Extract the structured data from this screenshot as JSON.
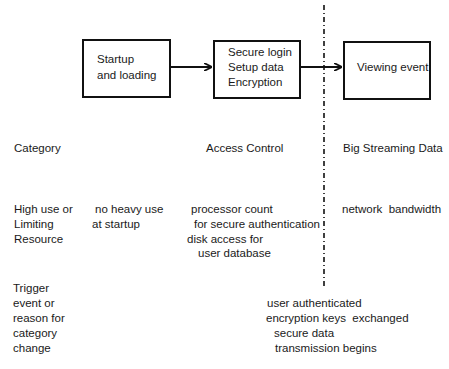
{
  "flow": {
    "boxes": [
      {
        "id": "startup",
        "lines": [
          "Startup",
          "and loading"
        ]
      },
      {
        "id": "secure-login",
        "lines": [
          "Secure login",
          "Setup data",
          "Encryption"
        ]
      },
      {
        "id": "viewing",
        "lines": [
          "Viewing event"
        ]
      }
    ],
    "arrows": [
      {
        "from": "startup",
        "to": "secure-login"
      },
      {
        "from": "secure-login",
        "to": "viewing"
      }
    ],
    "divider": {
      "style": "dash-dot",
      "between": [
        "secure-login",
        "viewing"
      ]
    }
  },
  "rows": {
    "category": {
      "label": "Category",
      "access_control": "Access Control",
      "big_streaming": "Big Streaming Data"
    },
    "resource": {
      "label_lines": [
        "High use or",
        "Limiting",
        "Resource"
      ],
      "startup_lines": [
        "no heavy use",
        "at startup"
      ],
      "access_lines": [
        "processor count",
        "for secure authentication",
        "disk access for",
        "user database"
      ],
      "streaming_lines": [
        "network  bandwidth"
      ]
    },
    "trigger": {
      "label_lines": [
        "Trigger",
        "event or",
        "reason for",
        "category",
        "change"
      ],
      "event_lines": [
        "user authenticated",
        "encryption keys  exchanged",
        "secure data",
        "transmission begins"
      ]
    }
  }
}
